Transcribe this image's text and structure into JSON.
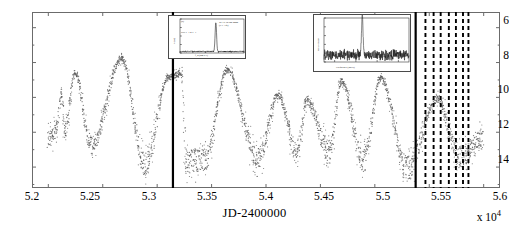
{
  "figure": {
    "kind": "scientific-figure",
    "background": "#ffffff"
  },
  "chart_data": {
    "type": "scatter",
    "title": "",
    "xlabel": "JD-2400000",
    "ylabel": "Visual magnitude",
    "x_multiplier": "x 10",
    "x_multiplier_exp": "4",
    "xlim": [
      5.185,
      5.615
    ],
    "ylim_display": [
      5.1,
      15.2
    ],
    "y_inverted": true,
    "grid": false,
    "legend": null,
    "xticks": [
      5.2,
      5.25,
      5.3,
      5.35,
      5.4,
      5.45,
      5.5,
      5.55,
      5.6
    ],
    "xtick_labels": [
      "5.2",
      "5.25",
      "5.3",
      "5.35",
      "5.4",
      "5.45",
      "5.5",
      "5.55",
      "5.6"
    ],
    "yticks": [
      6,
      8,
      10,
      12,
      14
    ],
    "ytick_labels": [
      "6",
      "8",
      "10",
      "12",
      "14"
    ],
    "marker": "dot",
    "marker_color": "#555555",
    "series": [
      {
        "name": "visual-magnitude",
        "cycles": [
          {
            "min_jd": 5.2,
            "max_jd": 5.208,
            "max_mag": 11.9,
            "min_mag": 12.6
          },
          {
            "min_jd": 5.2085,
            "peak_jd": 5.2115,
            "peak_mag": 9.8,
            "trough_jd": 5.2155,
            "trough_mag": 11.9
          },
          {
            "peak_jd": 5.2245,
            "peak_mag": 8.55,
            "trough_jd": 5.2395,
            "trough_mag": 12.8
          },
          {
            "peak_jd": 5.2675,
            "peak_mag": 7.75,
            "trough_jd": 5.2885,
            "trough_mag": 13.9
          },
          {
            "peak_jd": 5.3105,
            "peak_mag": 8.85,
            "trough_jd": 5.3265,
            "trough_mag": 13.7
          },
          {
            "peak_jd": 5.3225,
            "peak_mag": 8.6,
            "trough_jd": 5.3435,
            "trough_mag": 13.6
          },
          {
            "peak_jd": 5.3645,
            "peak_mag": 8.45,
            "trough_jd": 5.3925,
            "trough_mag": 13.5
          },
          {
            "peak_jd": 5.4115,
            "peak_mag": 9.9,
            "trough_jd": 5.4285,
            "trough_mag": 13.2
          },
          {
            "peak_jd": 5.4375,
            "peak_mag": 10.25,
            "trough_jd": 5.4585,
            "trough_mag": 13.1
          },
          {
            "peak_jd": 5.4695,
            "peak_mag": 9.05,
            "trough_jd": 5.4895,
            "trough_mag": 13.6
          },
          {
            "peak_jd": 5.5055,
            "peak_mag": 8.9,
            "trough_jd": 5.5295,
            "trough_mag": 14.1
          },
          {
            "peak_jd": 5.5575,
            "peak_mag": 10.1,
            "trough_jd": 5.5775,
            "trough_mag": 13.4
          }
        ]
      }
    ],
    "solid_vlines": [
      5.3145,
      5.5375
    ],
    "dashed_vlines": [
      5.5465,
      5.554,
      5.5605,
      5.568,
      5.5745,
      5.581,
      5.586
    ],
    "annotations": []
  },
  "insets": {
    "left": {
      "name": "spectrum-inset-left",
      "xlabel": "f_0 (km s-1)",
      "ylabel": "S (Jy)",
      "corner_label": "(a)",
      "left_note": "SiO J=1-0 v=1",
      "right_note": "IRAS 19190-2000\n(V1 Aql)",
      "xtick_labels": [
        "-80",
        "-60",
        "-40",
        "-20",
        "0",
        "20"
      ],
      "peak_position": 0.56,
      "peak_height": 0.86
    },
    "right": {
      "name": "spectrum-inset-right",
      "xlabel": "Frequency  (MHz)",
      "ylabel": "Flux density",
      "xtick_labels": [
        "43.110",
        "43.120",
        "43.130",
        "43.140"
      ],
      "peak_position": 0.45,
      "peak_height": 0.92,
      "noise": true
    }
  },
  "colors": {
    "axis": "#6b6b6b",
    "data": "#555555",
    "vline_solid": "#000000",
    "vline_dashed": "#000000",
    "inset_border": "#4a4a4a"
  }
}
